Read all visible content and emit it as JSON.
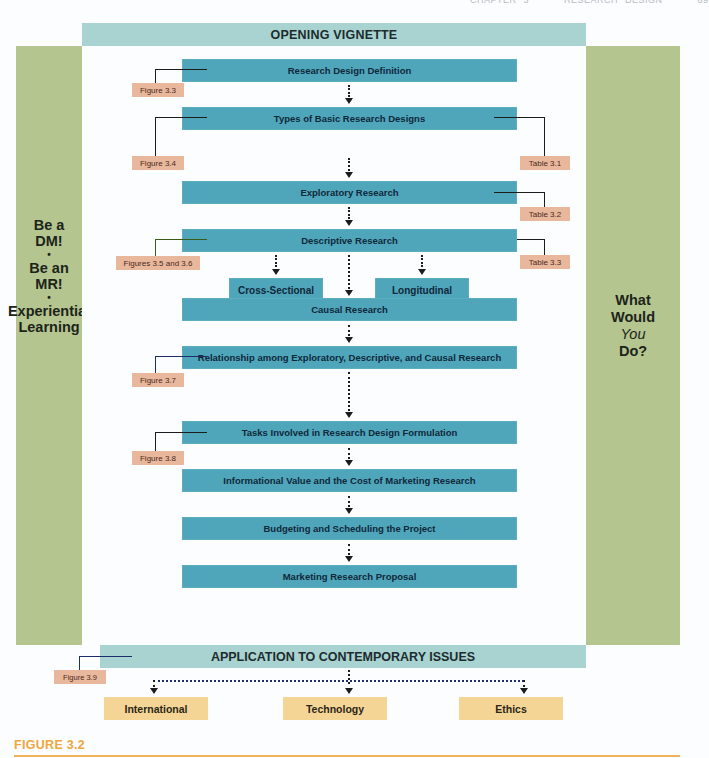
{
  "running_head": "CHAPTER 3     RESEARCH DESIGN     69",
  "figure": {
    "caption": "FIGURE 3.2",
    "top_banner": "OPENING VIGNETTE",
    "bottom_banner": "APPLICATION TO CONTEMPORARY ISSUES",
    "left_column": {
      "line1": "Be a",
      "line2": "DM!",
      "bullet1": "•",
      "line3": "Be an",
      "line4": "MR!",
      "bullet2": "•",
      "line5": "Experiential",
      "line6": "Learning"
    },
    "right_column": {
      "line1": "What",
      "line2": "Would",
      "line3_italic": "You",
      "line4": "Do?"
    },
    "flow_steps": [
      {
        "label": "Research Design Definition"
      },
      {
        "label": "Types of Basic Research Designs"
      },
      {
        "label": "Exploratory Research"
      },
      {
        "label": "Descriptive Research"
      },
      {
        "label": "Causal Research"
      },
      {
        "label": "Relationship among Exploratory, Descriptive, and Causal Research"
      },
      {
        "label": "Tasks Involved in Research Design Formulation"
      },
      {
        "label": "Informational Value and the Cost of Marketing Research"
      },
      {
        "label": "Budgeting and Scheduling the Project"
      },
      {
        "label": "Marketing Research Proposal"
      }
    ],
    "descriptive_subtypes": [
      {
        "label": "Cross-Sectional"
      },
      {
        "label": "Longitudinal"
      }
    ],
    "left_references": [
      {
        "label": "Figure 3.3",
        "attached_to": "Research Design Definition"
      },
      {
        "label": "Figure 3.4",
        "attached_to": "Types of Basic Research Designs"
      },
      {
        "label": "Figures 3.5 and 3.6",
        "attached_to": "Descriptive Research"
      },
      {
        "label": "Figure 3.7",
        "attached_to": "Relationship among Exploratory, Descriptive, and Causal Research"
      },
      {
        "label": "Figure 3.8",
        "attached_to": "Tasks Involved in Research Design Formulation"
      },
      {
        "label": "Figure 3.9",
        "attached_to": "APPLICATION TO CONTEMPORARY ISSUES"
      }
    ],
    "right_references": [
      {
        "label": "Table 3.1",
        "attached_to": "Types of Basic Research Designs"
      },
      {
        "label": "Table 3.2",
        "attached_to": "Exploratory Research"
      },
      {
        "label": "Table 3.3",
        "attached_to": "Descriptive Research"
      }
    ],
    "contemporary_issues": [
      {
        "label": "International"
      },
      {
        "label": "Technology"
      },
      {
        "label": "Ethics"
      }
    ],
    "colors": {
      "banner_teal": "#a8d3d0",
      "step_teal": "#4fa6bb",
      "side_green": "#b5c590",
      "reference_salmon": "#e9b89c",
      "issue_yellow": "#f5d596",
      "caption_orange": "#f0a640"
    }
  }
}
